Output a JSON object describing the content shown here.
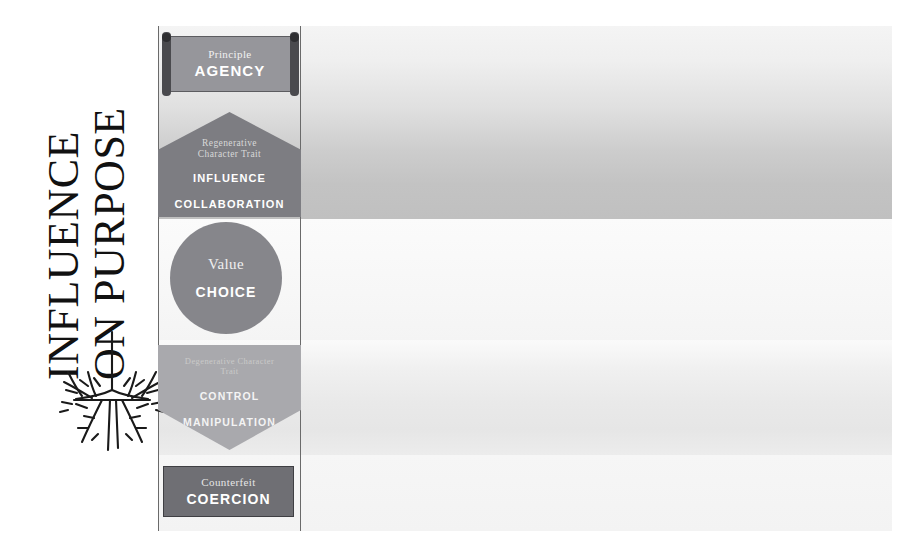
{
  "headline": {
    "line1": "INFLUENCE",
    "line2": "ON PURPOSE"
  },
  "graphics": {
    "roots_icon": "tree-roots-icon"
  },
  "levels": [
    {
      "shape": "scroll-banner",
      "caption": "Principle",
      "heading": "AGENCY",
      "fill": "#96969b"
    },
    {
      "shape": "pentagon-up",
      "caption_line1": "Regenerative",
      "caption_line2": "Character Trait",
      "heading_line1": "INFLUENCE",
      "heading_line2": "COLLABORATION",
      "fill": "#7d7d82"
    },
    {
      "shape": "circle",
      "caption": "Value",
      "heading": "CHOICE",
      "fill": "#86868b"
    },
    {
      "shape": "pentagon-down",
      "caption_line1": "Degenerative Character",
      "caption_line2": "Trait",
      "heading_line1": "CONTROL",
      "heading_line2": "MANIPULATION",
      "fill": "#a9a9ad"
    },
    {
      "shape": "rectangle",
      "caption": "Counterfeit",
      "heading": "COERCION",
      "fill": "#6f6f74"
    }
  ],
  "colors": {
    "page_background": "#ffffff",
    "field_background": "#f2f2f2",
    "rule": "#6a6a6a",
    "text_light": "#ffffff",
    "text_dark": "#111111"
  }
}
